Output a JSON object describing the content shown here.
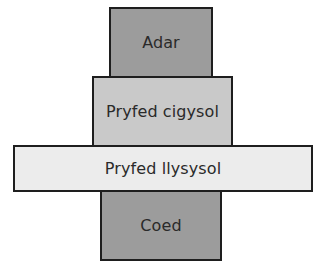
{
  "diagram": {
    "type": "pyramid of numbers",
    "levels": [
      {
        "label": "Adar",
        "order": 4,
        "fill": "#9c9c9c"
      },
      {
        "label": "Pryfed cigysol",
        "order": 3,
        "fill": "#c9c9c9"
      },
      {
        "label": "Pryfed llysysol",
        "order": 2,
        "fill": "#ececec"
      },
      {
        "label": "Coed",
        "order": 1,
        "fill": "#9c9c9c"
      }
    ]
  }
}
